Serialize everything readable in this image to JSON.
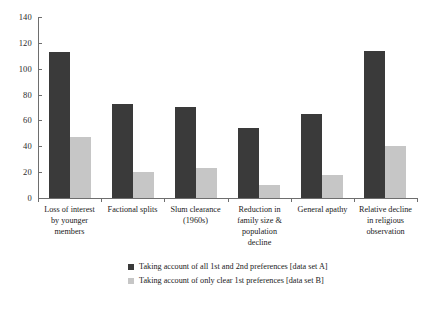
{
  "chart_data": {
    "type": "bar",
    "title": "",
    "subtitle": "",
    "xlabel": "",
    "ylabel": "",
    "ylim": [
      0,
      140
    ],
    "yticks": [
      0,
      20,
      40,
      60,
      80,
      100,
      120,
      140
    ],
    "grid": false,
    "legend_position": "bottom",
    "categories": [
      "Loss of interest by younger members",
      "Factional splits",
      "Slum clearance (1960s)",
      "Reduction in family size & population decline",
      "General apathy",
      "Relative decline in religious observation"
    ],
    "category_label_lines": [
      [
        "Loss of interest",
        "by younger",
        "members"
      ],
      [
        "Factional splits"
      ],
      [
        "Slum clearance",
        "(1960s)"
      ],
      [
        "Reduction in",
        "family size &",
        "population",
        "decline"
      ],
      [
        "General apathy"
      ],
      [
        "Relative decline",
        "in religious",
        "observation"
      ]
    ],
    "series": [
      {
        "name": "Taking account of all 1st and 2nd preferences [data set A]",
        "color": "#3a3a3a",
        "values": [
          113,
          73,
          70,
          54,
          65,
          114
        ]
      },
      {
        "name": "Taking account of only clear 1st preferences [data set B]",
        "color": "#c6c6c6",
        "values": [
          47,
          20,
          23,
          10,
          18,
          40
        ]
      }
    ]
  },
  "legend": {
    "items": [
      {
        "label": "Taking account of all 1st and 2nd preferences [data set A]",
        "color": "#3a3a3a"
      },
      {
        "label": "Taking account of only clear 1st preferences [data set B]",
        "color": "#c6c6c6"
      }
    ]
  },
  "axis": {
    "y_tick_labels": [
      "0",
      "20",
      "40",
      "60",
      "80",
      "100",
      "120",
      "140"
    ]
  }
}
